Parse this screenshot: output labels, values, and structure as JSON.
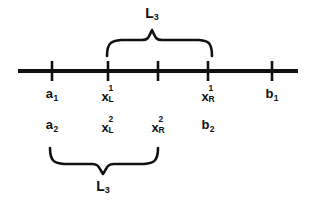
{
  "figure": {
    "background_color": "#ffffff",
    "ink_color": "#111111"
  },
  "axis": {
    "name": "main-number-line",
    "x_start": 18,
    "x_end": 298,
    "y": 71,
    "thickness": 4,
    "ticks": [
      {
        "id": "tick-a1",
        "x": 52,
        "labeled": true
      },
      {
        "id": "tick-xL1",
        "x": 108,
        "labeled": true
      },
      {
        "id": "tick-mid",
        "x": 158,
        "labeled": false
      },
      {
        "id": "tick-xR1",
        "x": 208,
        "labeled": true
      },
      {
        "id": "tick-b1",
        "x": 272,
        "labeled": true
      }
    ],
    "tick_top": 61,
    "tick_bottom": 81
  },
  "axis_labels": [
    {
      "id": "label-a1",
      "base": "a",
      "sub": "1",
      "sup": "",
      "x": 52,
      "y": 95
    },
    {
      "id": "label-xL1",
      "base": "x",
      "sub": "L",
      "sup": "1",
      "x": 108,
      "y": 95
    },
    {
      "id": "label-xR1",
      "base": "x",
      "sub": "R",
      "sup": "1",
      "x": 208,
      "y": 95
    },
    {
      "id": "label-b1",
      "base": "b",
      "sub": "1",
      "sup": "",
      "x": 272,
      "y": 95
    }
  ],
  "lower_labels": [
    {
      "id": "label-a2",
      "base": "a",
      "sub": "2",
      "sup": "",
      "x": 52,
      "y": 126
    },
    {
      "id": "label-xL2",
      "base": "x",
      "sub": "L",
      "sup": "2",
      "x": 108,
      "y": 126
    },
    {
      "id": "label-xR2",
      "base": "x",
      "sub": "R",
      "sup": "2",
      "x": 158,
      "y": 126
    },
    {
      "id": "label-b2",
      "base": "b",
      "sub": "2",
      "sup": "",
      "x": 208,
      "y": 126
    }
  ],
  "braces": [
    {
      "id": "upper-brace",
      "orientation": "down",
      "x_left": 107,
      "x_right": 212,
      "x_center": 152,
      "y_tip": 28,
      "y_arms": 55,
      "spans_from": "x_L^1",
      "spans_to": "x_R^1"
    },
    {
      "id": "lower-brace",
      "orientation": "up",
      "x_left": 50,
      "x_right": 158,
      "x_center": 103,
      "y_tip": 175,
      "y_arms": 148,
      "spans_from": "a_2",
      "spans_to": "x_R^2"
    }
  ],
  "brace_labels": [
    {
      "id": "upper-brace-label",
      "base": "L",
      "sub": "3",
      "x": 152,
      "y": 14
    },
    {
      "id": "lower-brace-label",
      "base": "L",
      "sub": "3",
      "x": 103,
      "y": 187
    }
  ]
}
